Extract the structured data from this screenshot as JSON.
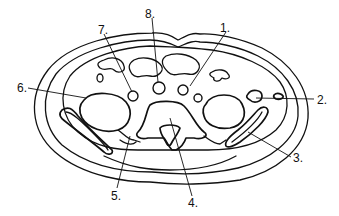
{
  "diagram": {
    "type": "anatomical cross-section",
    "labels": [
      {
        "id": "1",
        "text": "1.",
        "x": 220,
        "y": 22
      },
      {
        "id": "2",
        "text": "2.",
        "x": 317,
        "y": 94
      },
      {
        "id": "3",
        "text": "3.",
        "x": 293,
        "y": 152
      },
      {
        "id": "4",
        "text": "4.",
        "x": 188,
        "y": 197
      },
      {
        "id": "5",
        "text": "5.",
        "x": 111,
        "y": 190
      },
      {
        "id": "6",
        "text": "6.",
        "x": 17,
        "y": 82
      },
      {
        "id": "7",
        "text": "7.",
        "x": 98,
        "y": 24
      },
      {
        "id": "8",
        "text": "8.",
        "x": 145,
        "y": 8
      }
    ]
  }
}
